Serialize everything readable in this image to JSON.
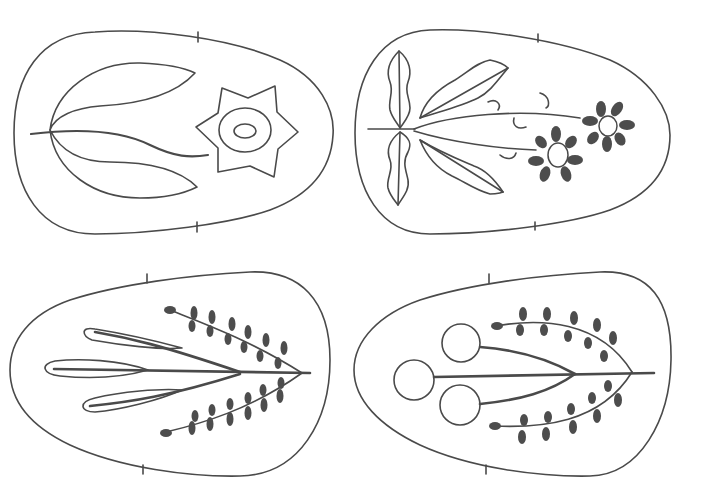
{
  "figure": {
    "description": "Four egg-shaped outline templates with folk-style botanical embroidery motifs",
    "background": "#ffffff",
    "stroke_color": "#4a4a4a",
    "fill_color": "#4d4d4d",
    "panels": [
      {
        "id": "top-left",
        "motif": "tulip leaves with six-pointed star flower"
      },
      {
        "id": "top-right",
        "motif": "wavy leaves with two filled daisies and curls"
      },
      {
        "id": "bottom-left",
        "motif": "three long petals with two leafy sprigs"
      },
      {
        "id": "bottom-right",
        "motif": "three circle buds with two leafy sprigs"
      }
    ]
  }
}
